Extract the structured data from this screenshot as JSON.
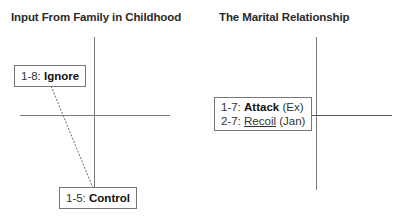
{
  "panels": [
    {
      "title": "Input From Family in Childhood",
      "labels": [
        {
          "code": "1-8:",
          "term": "Ignore",
          "style": "bold"
        },
        {
          "code": "1-5:",
          "term": "Control",
          "style": "bold"
        }
      ],
      "connector": {
        "from": "1-8: Ignore",
        "to": "1-5: Control",
        "style": "dashed"
      }
    },
    {
      "title": "The Marital Relationship",
      "labels": [
        {
          "code": "1-7:",
          "term": "Attack",
          "style": "bold",
          "suffix": "(Ex)"
        },
        {
          "code": "2-7:",
          "term": "Recoil",
          "style": "underline",
          "suffix": "(Jan)"
        }
      ]
    }
  ],
  "colors": {
    "axis": "#7a7a7a",
    "border": "#777777",
    "text": "#222222"
  }
}
